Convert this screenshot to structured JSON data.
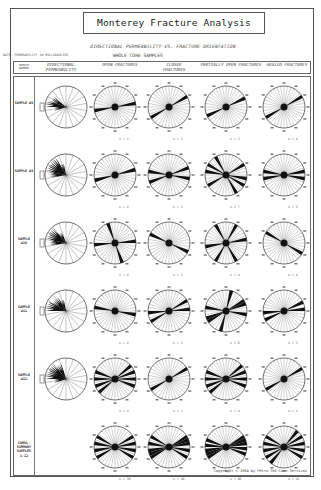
{
  "title": "Monterey Fracture Analysis",
  "subtitle": "DIRECTIONAL PERMEABILITY VS. FRACTURE ORIENTATION",
  "note": "NOTE: PERMEABILITY IN MILLIDARCIES",
  "section": "WHOLE CORE SAMPLES",
  "columns": [
    {
      "key": "sample",
      "label": "SAMPLE NUMBER"
    },
    {
      "key": "perm",
      "label": "DIRECTIONAL PERMEABILITY"
    },
    {
      "key": "open",
      "label": "OPEN FRACTURES"
    },
    {
      "key": "closed",
      "label": "CLOSED FRACTURES"
    },
    {
      "key": "partial",
      "label": "PARTIALLY OPEN FRACTURES"
    },
    {
      "key": "healed",
      "label": "HEALED FRACTURES"
    }
  ],
  "rows": [
    {
      "label": "SAMPLE #6",
      "n": [
        "n = 1",
        "n = 3",
        "n = 3",
        "n = 4"
      ],
      "spokes": {
        "open": [
          [
            80,
            260
          ]
        ],
        "closed": [
          [
            60,
            240
          ]
        ],
        "partial": [
          [
            65,
            245
          ]
        ],
        "healed": [
          [
            60,
            240
          ]
        ]
      },
      "perm": [
        [
          270,
          290,
          5
        ],
        [
          290,
          310,
          4
        ],
        [
          250,
          270,
          3
        ]
      ]
    },
    {
      "label": "SAMPLE #8",
      "n": [
        "n = 2",
        "n = 2",
        "n = 7",
        "n = 2"
      ],
      "spokes": {
        "open": [
          [
            75,
            255
          ]
        ],
        "closed": [
          [
            70,
            250
          ],
          [
            100,
            280
          ]
        ],
        "partial": [
          [
            60,
            240
          ],
          [
            120,
            300
          ],
          [
            100,
            280
          ],
          [
            150,
            330
          ]
        ],
        "healed": [
          [
            80,
            260
          ],
          [
            100,
            280
          ]
        ]
      },
      "perm": [
        [
          280,
          330,
          5
        ],
        [
          330,
          350,
          3
        ],
        [
          260,
          280,
          4
        ]
      ]
    },
    {
      "label": "SAMPLE #10",
      "n": [
        "n = 2",
        "n = 2",
        "n = 4",
        "n = 4"
      ],
      "spokes": {
        "open": [
          [
            85,
            265
          ],
          [
            160,
            340
          ]
        ],
        "closed": [
          [
            115,
            295
          ]
        ],
        "partial": [
          [
            80,
            260
          ],
          [
            150,
            330
          ],
          [
            30,
            210
          ]
        ],
        "healed": [
          [
            120,
            300
          ]
        ]
      },
      "perm": [
        [
          280,
          320,
          5
        ],
        [
          320,
          340,
          3
        ],
        [
          260,
          280,
          4
        ]
      ]
    },
    {
      "label": "SAMPLE #11",
      "n": [
        "n = 2",
        "n = 3",
        "n = 6",
        "n = 3"
      ],
      "spokes": {
        "open": [
          [
            100,
            280
          ]
        ],
        "closed": [
          [
            60,
            240
          ],
          [
            85,
            265
          ]
        ],
        "partial": [
          [
            15,
            195
          ],
          [
            70,
            250
          ],
          [
            100,
            280
          ],
          [
            60,
            240
          ]
        ],
        "healed": [
          [
            65,
            245
          ],
          [
            85,
            265
          ]
        ]
      },
      "perm": [
        [
          270,
          300,
          5
        ],
        [
          300,
          330,
          4
        ],
        [
          330,
          350,
          3
        ]
      ]
    },
    {
      "label": "SAMPLE #12",
      "n": [
        "n = 4",
        "n = 1",
        "n = 4",
        "n = 1"
      ],
      "spokes": {
        "open": [
          [
            50,
            230
          ],
          [
            70,
            250
          ],
          [
            90,
            270
          ],
          [
            110,
            290
          ]
        ],
        "closed": [
          [
            60,
            240
          ]
        ],
        "partial": [
          [
            50,
            230
          ],
          [
            70,
            250
          ],
          [
            90,
            270
          ],
          [
            110,
            290
          ]
        ],
        "healed": [
          [
            60,
            240
          ]
        ]
      },
      "perm": [
        [
          270,
          320,
          5
        ],
        [
          320,
          345,
          4
        ],
        [
          250,
          270,
          3
        ]
      ]
    },
    {
      "label": "CUMUL. SUMMARY SAMPLES 1-12",
      "n": [
        "n = 39",
        "n = 40",
        "n = 86",
        "n = 41"
      ],
      "spokes": {
        "open": [
          [
            80,
            260
          ],
          [
            100,
            280
          ],
          [
            60,
            240
          ],
          [
            120,
            300
          ]
        ],
        "closed": [
          [
            60,
            240
          ],
          [
            80,
            260
          ],
          [
            100,
            280
          ],
          [
            120,
            300
          ],
          [
            70,
            250
          ]
        ],
        "partial": [
          [
            80,
            260
          ],
          [
            95,
            275
          ],
          [
            60,
            240
          ],
          [
            110,
            290
          ],
          [
            70,
            250
          ]
        ],
        "healed": [
          [
            60,
            240
          ],
          [
            80,
            260
          ],
          [
            120,
            300
          ],
          [
            100,
            280
          ],
          [
            40,
            220
          ]
        ]
      },
      "perm": null
    }
  ],
  "copyright": "Copyright © 1984 by Petro Tek Core Services",
  "colors": {
    "ink": "#222222",
    "paper": "#ffffff",
    "line": "#555555"
  }
}
